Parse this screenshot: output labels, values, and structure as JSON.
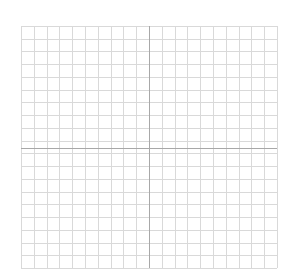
{
  "chart_data": {
    "type": "scatter",
    "title": "",
    "xlabel": "",
    "ylabel": "",
    "grid": true,
    "axes_visible": true,
    "tick_labels": false,
    "legend": null,
    "series": [],
    "grid_columns": 20,
    "grid_rows": 19,
    "plot_area": {
      "left": 21,
      "top": 26,
      "right": 277,
      "bottom": 268
    },
    "axis_x_pixel": 149,
    "axis_y_pixel": 148
  },
  "colors": {
    "background": "#ffffff",
    "grid": "#d9d9d9",
    "axis": "#a8a8a8"
  }
}
